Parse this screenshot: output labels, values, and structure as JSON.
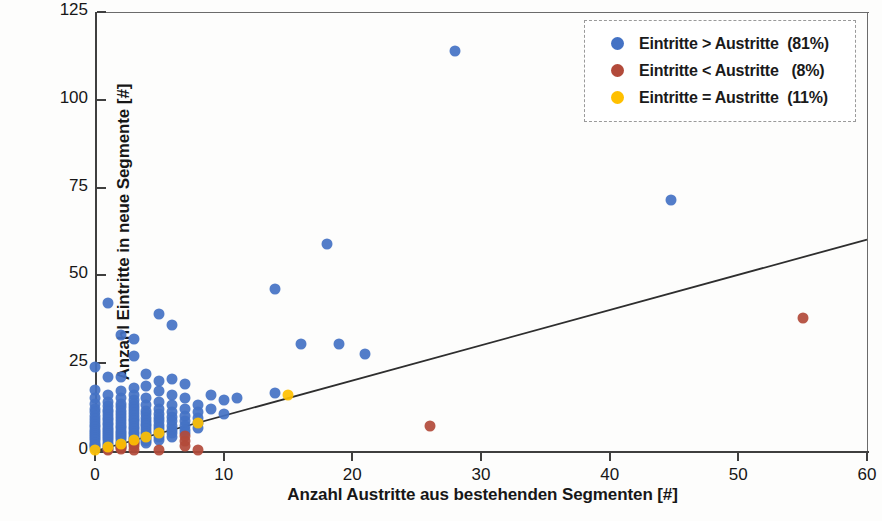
{
  "chart_data": {
    "type": "scatter",
    "title": "",
    "xlabel": "Anzahl Austritte aus bestehenden Segmenten [#]",
    "ylabel": "Anzahl Eintritte in neue Segmente [#]",
    "xlim": [
      0,
      60
    ],
    "ylim": [
      0,
      125
    ],
    "xticks": [
      0,
      10,
      20,
      30,
      40,
      50,
      60
    ],
    "yticks": [
      0,
      25,
      50,
      75,
      100,
      125
    ],
    "grid": false,
    "legend_position": "top-right",
    "legend": [
      {
        "label": "Eintritte > Austritte  (81%)",
        "color": "#4472c4",
        "series": "more_in"
      },
      {
        "label": "Eintritte < Austritte   (8%)",
        "color": "#b24a3a",
        "series": "more_out"
      },
      {
        "label": "Eintritte = Austritte  (11%)",
        "color": "#ffc000",
        "series": "equal"
      }
    ],
    "trendline": {
      "type": "linear",
      "x": [
        0,
        60
      ],
      "y": [
        0,
        60.2
      ],
      "color": "#2e2e2e",
      "width": 1.8
    },
    "series": [
      {
        "name": "Eintritte > Austritte  (81%)",
        "color": "#4472c4",
        "share_percent": 81,
        "points": [
          [
            0,
            24
          ],
          [
            0,
            17.5
          ],
          [
            0,
            15
          ],
          [
            0,
            13.5
          ],
          [
            0,
            12
          ],
          [
            0,
            11
          ],
          [
            0,
            10
          ],
          [
            0,
            9
          ],
          [
            0,
            8.2
          ],
          [
            0,
            7.5
          ],
          [
            0,
            6.8
          ],
          [
            0,
            6
          ],
          [
            0,
            5.4
          ],
          [
            0,
            4.8
          ],
          [
            0,
            4.2
          ],
          [
            0,
            3.6
          ],
          [
            0,
            3
          ],
          [
            0,
            2.4
          ],
          [
            0,
            1.8
          ],
          [
            0,
            1.3
          ],
          [
            0,
            0.8
          ],
          [
            1,
            42
          ],
          [
            1,
            21
          ],
          [
            1,
            16
          ],
          [
            1,
            14
          ],
          [
            1,
            12.8
          ],
          [
            1,
            11.8
          ],
          [
            1,
            11
          ],
          [
            1,
            10.2
          ],
          [
            1,
            9.4
          ],
          [
            1,
            8.7
          ],
          [
            1,
            8
          ],
          [
            1,
            7.3
          ],
          [
            1,
            6.6
          ],
          [
            1,
            6
          ],
          [
            1,
            5.4
          ],
          [
            1,
            4.8
          ],
          [
            1,
            4.2
          ],
          [
            1,
            3.6
          ],
          [
            1,
            3
          ],
          [
            1,
            2.4
          ],
          [
            1,
            1.8
          ],
          [
            1,
            1.2
          ],
          [
            1,
            0.7
          ],
          [
            2,
            33
          ],
          [
            2,
            21
          ],
          [
            2,
            17
          ],
          [
            2,
            15
          ],
          [
            2,
            13.5
          ],
          [
            2,
            12.4
          ],
          [
            2,
            11.4
          ],
          [
            2,
            10.5
          ],
          [
            2,
            9.6
          ],
          [
            2,
            8.8
          ],
          [
            2,
            8
          ],
          [
            2,
            7.2
          ],
          [
            2,
            6.5
          ],
          [
            2,
            5.8
          ],
          [
            2,
            5.1
          ],
          [
            2,
            4.5
          ],
          [
            2,
            3.9
          ],
          [
            2,
            3.3
          ],
          [
            2,
            2.7
          ],
          [
            2,
            2.1
          ],
          [
            2,
            1.5
          ],
          [
            2,
            1
          ],
          [
            3,
            32
          ],
          [
            3,
            27
          ],
          [
            3,
            18
          ],
          [
            3,
            16
          ],
          [
            3,
            14.5
          ],
          [
            3,
            13.4
          ],
          [
            3,
            12.5
          ],
          [
            3,
            11.6
          ],
          [
            3,
            10.8
          ],
          [
            3,
            10
          ],
          [
            3,
            9.2
          ],
          [
            3,
            8.4
          ],
          [
            3,
            7.6
          ],
          [
            3,
            6.9
          ],
          [
            3,
            6.2
          ],
          [
            3,
            5.5
          ],
          [
            3,
            4.8
          ],
          [
            3,
            4.1
          ],
          [
            3,
            3.4
          ],
          [
            3,
            2.8
          ],
          [
            3,
            2.2
          ],
          [
            4,
            22
          ],
          [
            4,
            18.5
          ],
          [
            4,
            15
          ],
          [
            4,
            13
          ],
          [
            4,
            11.5
          ],
          [
            4,
            10.4
          ],
          [
            4,
            9.5
          ],
          [
            4,
            8.6
          ],
          [
            4,
            7.8
          ],
          [
            4,
            7
          ],
          [
            4,
            6.2
          ],
          [
            4,
            5.5
          ],
          [
            4,
            4.8
          ],
          [
            4,
            4.1
          ],
          [
            4,
            3.4
          ],
          [
            4,
            2.8
          ],
          [
            4,
            2.2
          ],
          [
            5,
            39
          ],
          [
            5,
            20
          ],
          [
            5,
            17
          ],
          [
            5,
            14
          ],
          [
            5,
            12
          ],
          [
            5,
            10.5
          ],
          [
            5,
            9.4
          ],
          [
            5,
            8.4
          ],
          [
            5,
            7.4
          ],
          [
            5,
            6.5
          ],
          [
            5,
            5.6
          ],
          [
            5,
            4.8
          ],
          [
            5,
            4
          ],
          [
            5,
            3.2
          ],
          [
            6,
            36
          ],
          [
            6,
            20.5
          ],
          [
            6,
            16
          ],
          [
            6,
            13
          ],
          [
            6,
            11
          ],
          [
            6,
            9.6
          ],
          [
            6,
            8.4
          ],
          [
            6,
            7.2
          ],
          [
            6,
            6
          ],
          [
            6,
            5
          ],
          [
            6,
            4
          ],
          [
            7,
            19
          ],
          [
            7,
            15
          ],
          [
            7,
            12
          ],
          [
            7,
            10
          ],
          [
            7,
            8.5
          ],
          [
            7,
            7
          ],
          [
            7,
            6
          ],
          [
            7,
            5
          ],
          [
            8,
            13
          ],
          [
            8,
            11
          ],
          [
            8,
            9.5
          ],
          [
            8,
            8
          ],
          [
            8,
            6.5
          ],
          [
            9,
            16
          ],
          [
            9,
            12
          ],
          [
            10,
            14.5
          ],
          [
            10,
            10.5
          ],
          [
            11,
            15
          ],
          [
            14,
            46
          ],
          [
            14,
            16.5
          ],
          [
            16,
            30.5
          ],
          [
            18,
            59
          ],
          [
            19,
            30.5
          ],
          [
            21,
            27.5
          ],
          [
            28,
            114
          ],
          [
            44.8,
            71.5
          ]
        ]
      },
      {
        "name": "Eintritte < Austritte   (8%)",
        "color": "#b24a3a",
        "share_percent": 8,
        "points": [
          [
            1,
            0.4
          ],
          [
            2,
            0.5
          ],
          [
            2,
            1.2
          ],
          [
            3,
            0.4
          ],
          [
            3,
            1.5
          ],
          [
            3,
            2.2
          ],
          [
            5,
            0.3
          ],
          [
            7,
            1.5
          ],
          [
            7,
            2.8
          ],
          [
            7,
            4.2
          ],
          [
            8,
            0.3
          ],
          [
            26,
            7
          ],
          [
            55,
            38
          ]
        ]
      },
      {
        "name": "Eintritte = Austritte  (11%)",
        "color": "#ffc000",
        "share_percent": 11,
        "points": [
          [
            0,
            0.4
          ],
          [
            1,
            1.2
          ],
          [
            2,
            2
          ],
          [
            3,
            3
          ],
          [
            4,
            4
          ],
          [
            5,
            5
          ],
          [
            8,
            8
          ],
          [
            15,
            16
          ]
        ]
      }
    ]
  }
}
